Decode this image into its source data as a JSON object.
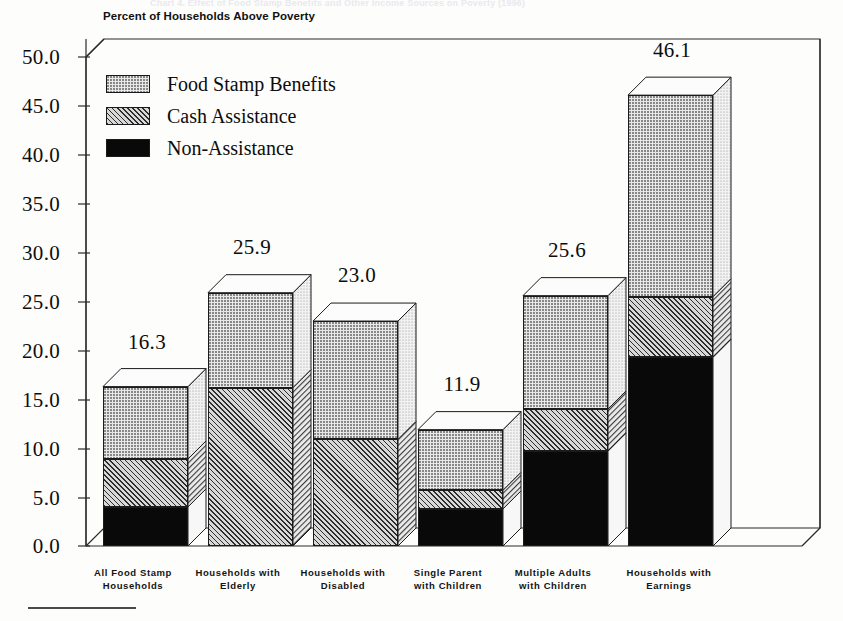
{
  "ghost_header_text": "Chart 4. Effect of Food Stamp Benefits and Other Income Sources on Poverty (1996)",
  "chart_title": "Percent of Households Above Poverty",
  "footnote_rule": "rule",
  "legend": {
    "position": "inside-upper-left",
    "items": [
      {
        "label": "Food Stamp Benefits",
        "key": "food_stamp",
        "pattern": "dotted-light"
      },
      {
        "label": "Cash Assistance",
        "key": "cash_assistance",
        "pattern": "diagonal-hatch"
      },
      {
        "label": "Non-Assistance",
        "key": "non_assistance",
        "pattern": "solid-black"
      }
    ]
  },
  "yaxis": {
    "ticks": [
      "50.0",
      "45.0",
      "40.0",
      "35.0",
      "30.0",
      "25.0",
      "20.0",
      "15.0",
      "10.0",
      "5.0",
      "0.0"
    ],
    "min": 0,
    "max": 50,
    "step": 5
  },
  "chart_data": {
    "type": "bar",
    "subtype": "stacked-3d-column",
    "title": "Percent of Households Above Poverty",
    "xlabel": "",
    "ylabel": "",
    "ylim": [
      0,
      50
    ],
    "grid": false,
    "legend_position": "inside-upper-left",
    "categories": [
      "All Food Stamp Households",
      "Households with Elderly",
      "Households with Disabled",
      "Single Parent with Children",
      "Multiple Adults with Children",
      "Households with Earnings"
    ],
    "category_lines": [
      [
        "All Food Stamp",
        "Households"
      ],
      [
        "Households with",
        "Elderly"
      ],
      [
        "Households with",
        "Disabled"
      ],
      [
        "Single Parent",
        "with Children"
      ],
      [
        "Multiple Adults",
        "with Children"
      ],
      [
        "Households with",
        "Earnings"
      ]
    ],
    "series": [
      {
        "name": "Non-Assistance",
        "values": [
          4.0,
          0.0,
          0.0,
          3.8,
          9.7,
          19.3
        ]
      },
      {
        "name": "Cash Assistance",
        "values": [
          4.9,
          16.2,
          10.9,
          1.9,
          4.3,
          6.2
        ]
      },
      {
        "name": "Food Stamp Benefits",
        "values": [
          7.4,
          9.7,
          12.1,
          6.2,
          11.6,
          20.6
        ]
      }
    ],
    "totals": [
      16.3,
      25.9,
      23.0,
      11.9,
      25.6,
      46.1
    ],
    "total_labels": [
      "16.3",
      "25.9",
      "23.0",
      "11.9",
      "25.6",
      "46.1"
    ]
  }
}
